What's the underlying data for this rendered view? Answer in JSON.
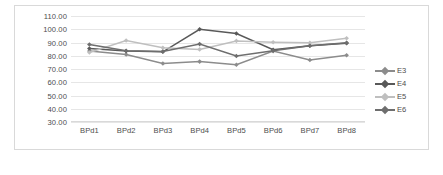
{
  "chart_data": {
    "type": "line",
    "title": "",
    "xlabel": "",
    "ylabel": "",
    "categories": [
      "BPd1",
      "BPd2",
      "BPd3",
      "BPd4",
      "BPd5",
      "BPd6",
      "BPd7",
      "BPd8"
    ],
    "ylim": [
      30,
      110
    ],
    "ytick_labels": [
      "110.00",
      "100.00",
      "90.00",
      "80.00",
      "70.00",
      "60.00",
      "50.00",
      "40.00",
      "30.00"
    ],
    "ytick_values": [
      110,
      100,
      90,
      80,
      70,
      60,
      50,
      40,
      30
    ],
    "grid": true,
    "legend_position": "right",
    "marker": "diamond",
    "series": [
      {
        "name": "E3",
        "color": "#8c8c8c",
        "values": [
          83.5,
          81.0,
          74.2,
          75.6,
          73.2,
          83.5,
          76.8,
          80.4
        ]
      },
      {
        "name": "E4",
        "color": "#595959",
        "values": [
          85.5,
          83.5,
          83.0,
          100.0,
          96.8,
          84.5,
          87.5,
          89.5
        ]
      },
      {
        "name": "E5",
        "color": "#bfbfbf",
        "values": [
          82.5,
          91.5,
          86.0,
          84.8,
          91.2,
          90.2,
          89.8,
          93.2
        ]
      },
      {
        "name": "E6",
        "color": "#6e6e6e",
        "values": [
          88.5,
          83.8,
          83.2,
          88.8,
          79.8,
          83.8,
          87.5,
          89.8
        ]
      }
    ]
  },
  "legend": {
    "items": [
      {
        "label": "E3"
      },
      {
        "label": "E4"
      },
      {
        "label": "E5"
      },
      {
        "label": "E6"
      }
    ]
  },
  "caption": {
    "text": ""
  }
}
